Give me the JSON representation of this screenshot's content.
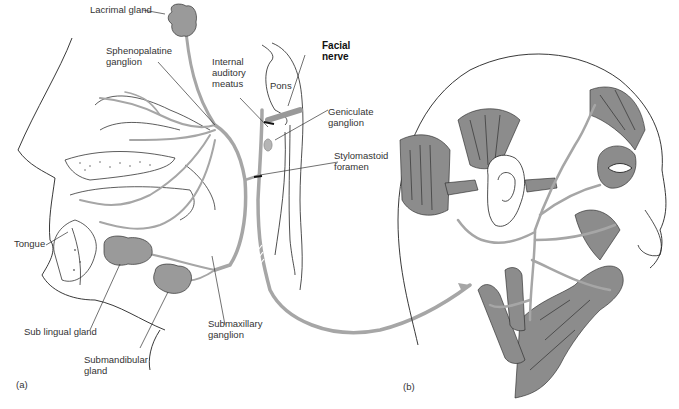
{
  "figure": {
    "panel_a": {
      "tag": "(a)",
      "labels": {
        "lacrimal_gland": "Lacrimal gland",
        "sphenopalatine_ganglion": "Sphenopalatine\nganglion",
        "internal_auditory_meatus": "Internal\nauditory\nmeatus",
        "pons": "Pons",
        "facial_nerve": "Facial\nnerve",
        "geniculate_ganglion": "Geniculate\nganglion",
        "stylomastoid_foramen": "Stylomastoid\nforamen",
        "tongue": "Tongue",
        "sublingual_gland": "Sub lingual gland",
        "submandibular_gland": "Submandibular\ngland",
        "submaxillary_ganglion": "Submaxillary\nganglion"
      }
    },
    "panel_b": {
      "tag": "(b)"
    },
    "colors": {
      "nerve": "#a6a6a6",
      "muscle": "#8c8c8c",
      "outline": "#222222",
      "gland": "#9a9a9a"
    }
  }
}
